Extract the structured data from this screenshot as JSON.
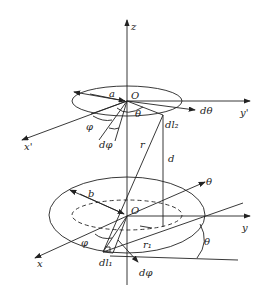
{
  "diagram": {
    "labels": {
      "z_axis": "z",
      "top_origin": "O",
      "top_radius": "a",
      "y_prime_axis": "y'",
      "x_prime_axis": "x'",
      "top_dtheta": "dθ",
      "top_theta": "θ",
      "top_phi": "φ",
      "top_dphi": "dφ",
      "top_dl": "dl₂",
      "distance_r": "r",
      "distance_d": "d",
      "bottom_origin": "O",
      "bottom_radius": "b",
      "bottom_theta_axis": "θ",
      "y_axis": "y",
      "x_axis": "x",
      "bottom_phi": "φ",
      "bottom_r1": "r₁",
      "bottom_theta_angle": "θ",
      "bottom_dl": "dl₁",
      "bottom_dphi": "dφ"
    }
  }
}
